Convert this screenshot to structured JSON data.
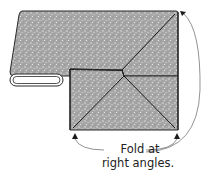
{
  "diagram": {
    "caption_line1": "Fold at",
    "caption_line2": "right angles.",
    "colors": {
      "fabric_fill": "#a9a9a9",
      "outline": "#2a2a2a",
      "arrow": "#1a1a1a",
      "leader_line": "#777777",
      "background": "#ffffff"
    },
    "elements": [
      "fabric-band",
      "folded-roll",
      "mitered-square",
      "fold-diagonals",
      "left-arrow",
      "right-arrow",
      "curved-leader-lines"
    ]
  }
}
